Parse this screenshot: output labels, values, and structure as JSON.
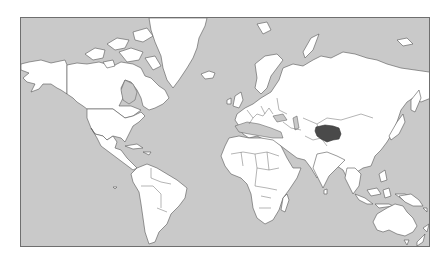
{
  "map": {
    "projection": "mercator",
    "colors": {
      "ocean": "#c9c9c9",
      "land": "#ffffff",
      "border": "#555555",
      "highlight": "#4a4a4a",
      "frame": "#6f6f6f"
    },
    "highlighted_region": {
      "name": "Tibet"
    },
    "regions": [
      "North America",
      "Greenland",
      "South America",
      "Europe",
      "Africa",
      "Asia",
      "Australia",
      "New Zealand"
    ]
  }
}
